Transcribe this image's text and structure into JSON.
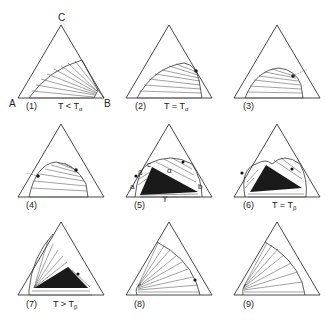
{
  "figure": {
    "vertex_labels": {
      "top": "C",
      "left": "A",
      "right": "B"
    },
    "region_labels_panel5": {
      "a": "a",
      "b": "b",
      "c": "c",
      "alpha": "α",
      "beta": "β",
      "gamma": "γ"
    },
    "panels": [
      {
        "id": "1",
        "label": "(1)",
        "condition": "T < T",
        "condition_sub": "α"
      },
      {
        "id": "2",
        "label": "(2)",
        "condition": "T = T",
        "condition_sub": "α"
      },
      {
        "id": "3",
        "label": "(3)",
        "condition": "",
        "condition_sub": ""
      },
      {
        "id": "4",
        "label": "(4)",
        "condition": "",
        "condition_sub": ""
      },
      {
        "id": "5",
        "label": "(5)",
        "condition": "",
        "condition_sub": ""
      },
      {
        "id": "6",
        "label": "(6)",
        "condition": "T = T",
        "condition_sub": "β"
      },
      {
        "id": "7",
        "label": "(7)",
        "condition": "T > T",
        "condition_sub": "β"
      },
      {
        "id": "8",
        "label": "(8)",
        "condition": "",
        "condition_sub": ""
      },
      {
        "id": "9",
        "label": "(9)",
        "condition": "",
        "condition_sub": ""
      }
    ]
  },
  "colors": {
    "line": "#333333",
    "fill_three_phase": "#1a1a1a",
    "background": "#ffffff"
  }
}
